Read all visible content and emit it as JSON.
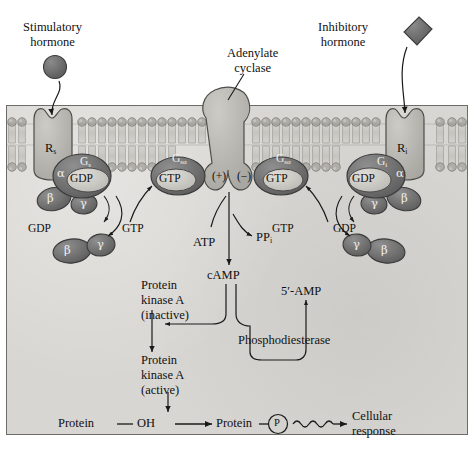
{
  "diagram": {
    "colors": {
      "background": "#ffffff",
      "cell_interior": "#d8d6d2",
      "receptor_fill": "#b9b7b2",
      "cyclase_fill": "#b9b7b2",
      "g_alpha_fill": "#6b6b6b",
      "g_complex_fill": "#8a8a8a",
      "nucleotide_fill": "#c9c7c2",
      "hormone_fill": "#6f6f6f",
      "membrane_head": "#a8a6a1",
      "membrane_tail": "#cfcdc8",
      "frame_border": "#6e6c68",
      "ink": "#111111"
    }
  },
  "labels": {
    "stimulatory_hormone": "Stimulatory\nhormone",
    "stimulatory_hormone_l1": "Stimulatory",
    "stimulatory_hormone_l2": "hormone",
    "inhibitory_hormone_l1": "Inhibitory",
    "inhibitory_hormone_l2": "hormone",
    "adenylate_cyclase_l1": "Adenylate",
    "adenylate_cyclase_l2": "cyclase",
    "receptor_stimulatory": "R",
    "receptor_stimulatory_sub": "s",
    "receptor_inhibitory": "R",
    "receptor_inhibitory_sub": "i",
    "g_s": "G",
    "g_s_sub": "s",
    "g_i": "G",
    "g_i_sub": "i",
    "g_s_alpha": "G",
    "g_s_alpha_sub": "sα",
    "alpha": "α",
    "beta": "β",
    "gamma": "γ",
    "gdp": "GDP",
    "gtp": "GTP",
    "plus": "(+)",
    "minus": "(−)",
    "atp": "ATP",
    "ppi": "PP",
    "ppi_sub": "i",
    "camp": "cAMP",
    "amp5": "5′-AMP",
    "phosphodiesterase": "Phosphodiesterase",
    "pka_inactive_l1": "Protein",
    "pka_inactive_l2": "kinase A",
    "pka_inactive_l3": "(inactive)",
    "pka_active_l1": "Protein",
    "pka_active_l2": "kinase A",
    "pka_active_l3": "(active)",
    "protein_oh": "Protein — OH",
    "protein": "Protein",
    "phosphate": "P",
    "cellular_response_l1": "Cellular",
    "cellular_response_l2": "response",
    "gdp_release_left": "GDP",
    "gtp_bind_left": "GTP",
    "gdp_release_right": "GDP",
    "gtp_bind_right": "GTP"
  }
}
